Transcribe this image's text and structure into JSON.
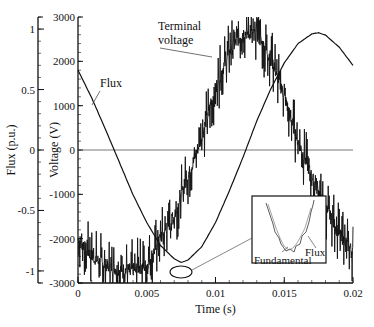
{
  "chart_data": {
    "type": "line",
    "title": "",
    "xlabel": "Time (s)",
    "ylabel_left_outer": "Flux (p.u.)",
    "ylabel_left_inner": "Voltage (V)",
    "xlim": [
      0,
      0.02
    ],
    "ylim_voltage": [
      -3000,
      3000
    ],
    "ylim_flux": [
      -1.1,
      1.1
    ],
    "x_ticks": [
      "0",
      "0.005",
      "0.01",
      "0.015",
      "0.02"
    ],
    "voltage_ticks": [
      "3000",
      "2000",
      "1000",
      "0",
      "-1000",
      "-2000",
      "-3000"
    ],
    "flux_ticks": [
      "1",
      "0.5",
      "0",
      "-0.5",
      "-1"
    ],
    "grid": false,
    "zero_line": true,
    "series": [
      {
        "name": "Flux",
        "axis": "flux",
        "style": "smooth",
        "x": [
          0,
          0.001,
          0.002,
          0.003,
          0.004,
          0.005,
          0.006,
          0.007,
          0.0075,
          0.008,
          0.009,
          0.01,
          0.011,
          0.012,
          0.013,
          0.014,
          0.015,
          0.016,
          0.017,
          0.0175,
          0.018,
          0.019,
          0.02
        ],
        "values": [
          0.66,
          0.43,
          0.17,
          -0.1,
          -0.37,
          -0.6,
          -0.79,
          -0.9,
          -0.93,
          -0.91,
          -0.8,
          -0.6,
          -0.34,
          -0.06,
          0.24,
          0.5,
          0.72,
          0.88,
          0.96,
          0.97,
          0.95,
          0.85,
          0.7
        ]
      },
      {
        "name": "Terminal voltage",
        "axis": "voltage",
        "style": "noisy",
        "x": [
          0,
          0.001,
          0.002,
          0.003,
          0.004,
          0.005,
          0.006,
          0.007,
          0.008,
          0.009,
          0.01,
          0.011,
          0.012,
          0.013,
          0.014,
          0.015,
          0.016,
          0.017,
          0.018,
          0.019,
          0.02
        ],
        "values": [
          -2000,
          -2400,
          -2600,
          -2700,
          -2700,
          -2600,
          -2000,
          -1500,
          -600,
          300,
          1400,
          2200,
          2650,
          2600,
          2100,
          1200,
          200,
          -600,
          -1300,
          -1900,
          -2300
        ]
      }
    ],
    "annotations": [
      {
        "text": "Flux",
        "target": "flux curve near t=0.002"
      },
      {
        "text": "Terminal voltage",
        "target": "voltage waveform near t=0.009"
      },
      {
        "text": "Fundamental",
        "target": "inset"
      },
      {
        "text": "Flux",
        "target": "inset"
      }
    ],
    "inset": {
      "description": "Zoomed view of flux minimum near t=0.0075 (ellipse)",
      "labels": [
        "Fundamental",
        "Flux"
      ]
    }
  },
  "labels": {
    "flux_annotation": "Flux",
    "voltage_annotation_line1": "Terminal",
    "voltage_annotation_line2": "voltage",
    "inset_fundamental": "Fundamental",
    "inset_flux": "Flux"
  }
}
